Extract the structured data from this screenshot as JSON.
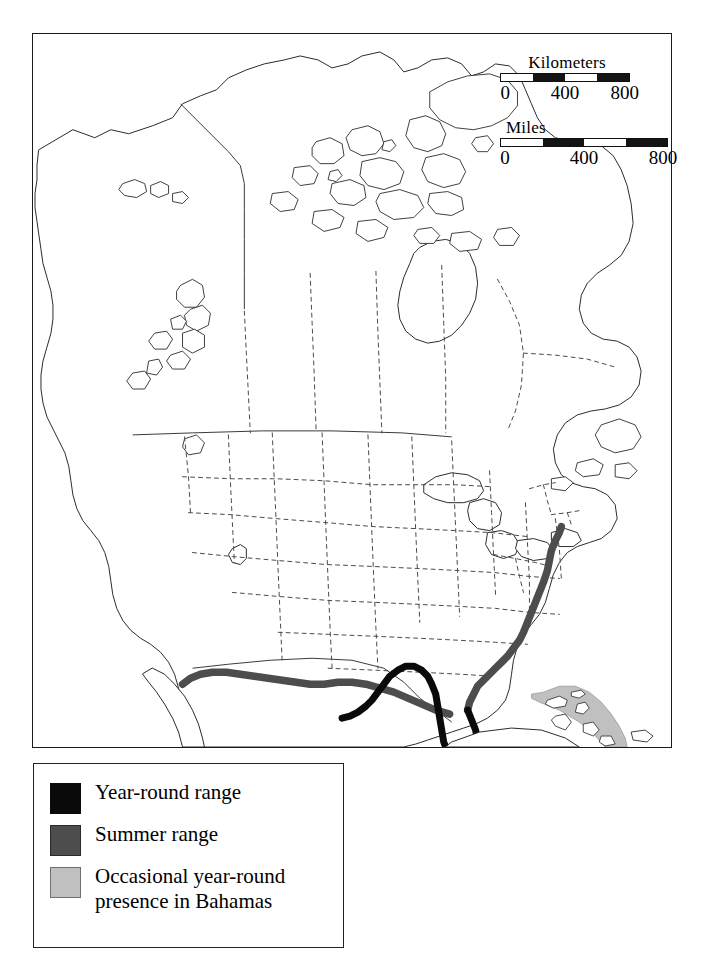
{
  "map": {
    "title_region": "North America",
    "frame": {
      "x": 32,
      "y": 33,
      "width": 640,
      "height": 715
    }
  },
  "scales": [
    {
      "id": "kilometers",
      "unit_label": "Kilometers",
      "ticks": [
        "0",
        "400",
        "800"
      ],
      "tick_positions": [
        0,
        50,
        100
      ],
      "segments": [
        "light",
        "dark",
        "light",
        "dark"
      ]
    },
    {
      "id": "miles",
      "unit_label": "Miles",
      "ticks": [
        "0",
        "400",
        "800"
      ],
      "tick_positions": [
        0,
        50,
        100
      ],
      "segments": [
        "light",
        "dark",
        "light",
        "dark"
      ]
    }
  ],
  "legend": {
    "items": [
      {
        "label": "Year-round range",
        "swatch": "sw-black",
        "color": "#0a0a0a",
        "swatch_name": "legend-swatch-year-round"
      },
      {
        "label": "Summer range",
        "swatch": "sw-dark",
        "color": "#4d4d4d",
        "swatch_name": "legend-swatch-summer"
      },
      {
        "label": "Occasional year-round\npresence in Bahamas",
        "swatch": "sw-light",
        "color": "#c0c0c0",
        "swatch_name": "legend-swatch-occasional"
      }
    ]
  },
  "colors": {
    "year_round": "#0a0a0a",
    "summer": "#4d4d4d",
    "occasional": "#c0c0c0",
    "coastline": "#2b2b2b",
    "border_internal": "#555555",
    "frame": "#1a1a1a",
    "background": "#ffffff"
  },
  "ranges": {
    "year_round_description": "Solid black band along the Florida peninsula and eastern Gulf coast",
    "summer_description": "Dark gray band along the Atlantic coast from Florida north to Massachusetts and west along the Gulf coast to Texas",
    "occasional_description": "Light gray shaded area over the Bahamas archipelago"
  }
}
